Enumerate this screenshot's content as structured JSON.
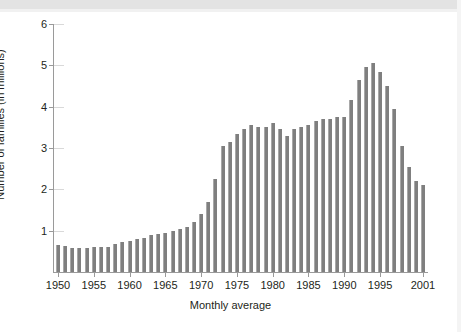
{
  "figure": {
    "background_color": "#ffffff",
    "bar_color": "#7f7f7f",
    "axis_color": "#9a9a9a",
    "text_color": "#231f20"
  },
  "chart_data": {
    "type": "bar",
    "title": "",
    "subtitle": "",
    "xlabel": "Monthly average",
    "ylabel": "Number of families (in millions)",
    "xlim": [
      1949.3,
      2001.7
    ],
    "ylim": [
      0,
      6
    ],
    "yticks": [
      1,
      2,
      3,
      4,
      5,
      6
    ],
    "ytick_labels": [
      "1",
      "2",
      "3",
      "4",
      "5",
      "6"
    ],
    "xticks": [
      1950,
      1955,
      1960,
      1965,
      1970,
      1975,
      1980,
      1985,
      1990,
      1995,
      2001
    ],
    "xtick_labels": [
      "1950",
      "1955",
      "1960",
      "1965",
      "1970",
      "1975",
      "1980",
      "1985",
      "1990",
      "1995",
      "2001"
    ],
    "grid": false,
    "legend": null,
    "categories": [
      "1950",
      "1951",
      "1952",
      "1953",
      "1954",
      "1955",
      "1956",
      "1957",
      "1958",
      "1959",
      "1960",
      "1961",
      "1962",
      "1963",
      "1964",
      "1965",
      "1966",
      "1967",
      "1968",
      "1969",
      "1970",
      "1971",
      "1972",
      "1973",
      "1974",
      "1975",
      "1976",
      "1977",
      "1978",
      "1979",
      "1980",
      "1981",
      "1982",
      "1983",
      "1984",
      "1985",
      "1986",
      "1987",
      "1988",
      "1989",
      "1990",
      "1991",
      "1992",
      "1993",
      "1994",
      "1995",
      "1996",
      "1997",
      "1998",
      "1999",
      "2000",
      "2001"
    ],
    "values": [
      0.65,
      0.62,
      0.58,
      0.57,
      0.57,
      0.6,
      0.61,
      0.6,
      0.67,
      0.72,
      0.75,
      0.79,
      0.82,
      0.89,
      0.93,
      0.95,
      1.0,
      1.04,
      1.08,
      1.2,
      1.4,
      1.7,
      2.25,
      3.05,
      3.15,
      3.35,
      3.45,
      3.55,
      3.5,
      3.5,
      3.6,
      3.45,
      3.3,
      3.45,
      3.5,
      3.55,
      3.65,
      3.7,
      3.7,
      3.75,
      3.75,
      4.15,
      4.65,
      4.95,
      5.05,
      4.85,
      4.5,
      3.95,
      3.05,
      2.55,
      2.2,
      2.1
    ]
  }
}
